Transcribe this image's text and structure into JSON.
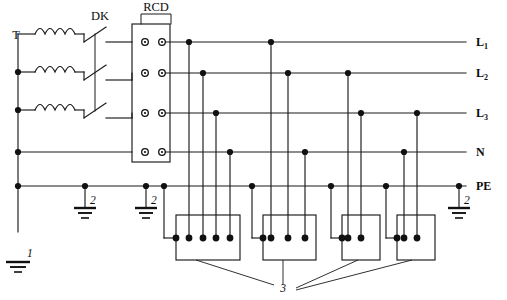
{
  "diagram": {
    "type": "electrical-schematic",
    "width": 507,
    "height": 300,
    "line_color": "#1a1a1a",
    "background": "#ffffff"
  },
  "components": {
    "transformer": {
      "label": "T",
      "name": "three-phase transformer windings",
      "winding_count": 3
    },
    "main_switch": {
      "label": "DK",
      "name": "ganged three-pole main disconnect switch",
      "pole_count": 3
    },
    "rcd": {
      "label": "RCD",
      "name": "residual current device",
      "terminal_rows": 4
    }
  },
  "bus_labels": [
    {
      "id": "L1",
      "base": "L",
      "sub": "1"
    },
    {
      "id": "L2",
      "base": "L",
      "sub": "2"
    },
    {
      "id": "L3",
      "base": "L",
      "sub": "3"
    },
    {
      "id": "N",
      "base": "N",
      "sub": ""
    },
    {
      "id": "PE",
      "base": "PE",
      "sub": ""
    }
  ],
  "callouts": [
    {
      "id": "callout-1",
      "label": "1",
      "meaning": "main earthing electrode"
    },
    {
      "id": "callout-2a",
      "label": "2",
      "meaning": "repeated earthing"
    },
    {
      "id": "callout-2b",
      "label": "2",
      "meaning": "repeated earthing"
    },
    {
      "id": "callout-2c",
      "label": "2",
      "meaning": "repeated earthing"
    },
    {
      "id": "callout-3",
      "label": "3",
      "meaning": "socket outlets / loads"
    }
  ],
  "earth_symbols": [
    {
      "name": "main-earth",
      "label": "1"
    },
    {
      "name": "repeat-earth-left",
      "label": "2"
    },
    {
      "name": "repeat-earth-mid",
      "label": "2"
    },
    {
      "name": "repeat-earth-right",
      "label": "2"
    }
  ],
  "sockets": [
    {
      "name": "socket-outlet-1",
      "terminals": 5,
      "conductors": [
        "L1",
        "L2",
        "L3",
        "N",
        "PE"
      ]
    },
    {
      "name": "socket-outlet-2",
      "terminals": 4,
      "conductors": [
        "L1",
        "L2",
        "N",
        "PE"
      ]
    },
    {
      "name": "socket-outlet-3",
      "terminals": 3,
      "conductors": [
        "L1",
        "N",
        "PE"
      ]
    },
    {
      "name": "socket-outlet-4",
      "terminals": 3,
      "conductors": [
        "L2",
        "N",
        "PE"
      ]
    }
  ]
}
